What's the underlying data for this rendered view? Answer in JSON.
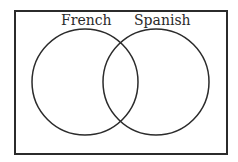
{
  "diagram": {
    "type": "venn",
    "universe": {
      "x": 15,
      "y": 11,
      "width": 212,
      "height": 143,
      "stroke": "#2b2b2b"
    },
    "sets": [
      {
        "label": "French",
        "cx": 85,
        "cy": 82,
        "r": 53,
        "label_x": 61,
        "label_y": 24
      },
      {
        "label": "Spanish",
        "cx": 156,
        "cy": 82,
        "r": 53,
        "label_x": 134,
        "label_y": 24
      }
    ],
    "stroke_color": "#2b2b2b"
  }
}
